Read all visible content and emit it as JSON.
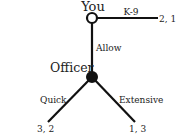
{
  "diagram": {
    "type": "game-tree",
    "colors": {
      "line": "#111111",
      "text": "#222222",
      "background": "#ffffff"
    },
    "nodes": {
      "root": {
        "label": "You",
        "style": "hollow"
      },
      "officer": {
        "label": "Officer",
        "style": "filled"
      }
    },
    "edges": {
      "k9": {
        "label": "K-9",
        "payoff": "2, 1"
      },
      "allow": {
        "label": "Allow"
      },
      "quick": {
        "label": "Quick",
        "payoff": "3, 2"
      },
      "extensive": {
        "label": "Extensive",
        "payoff": "1, 3"
      }
    }
  }
}
